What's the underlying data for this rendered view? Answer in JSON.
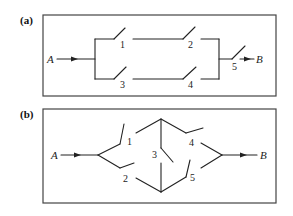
{
  "panels": [
    {
      "id": "a",
      "label": "(a)",
      "input": "A",
      "output": "B",
      "switches": [
        {
          "label": "1"
        },
        {
          "label": "2"
        },
        {
          "label": "3"
        },
        {
          "label": "4"
        },
        {
          "label": "5"
        }
      ],
      "description": "Switches 1-2 in series parallel with switches 3-4 in series, followed by switch 5 in series"
    },
    {
      "id": "b",
      "label": "(b)",
      "input": "A",
      "output": "B",
      "switches": [
        {
          "label": "1"
        },
        {
          "label": "2"
        },
        {
          "label": "3"
        },
        {
          "label": "4"
        },
        {
          "label": "5"
        }
      ],
      "description": "Bridge network: switches 1 and 2 from A, switch 3 bridging, switches 4 and 5 to B"
    }
  ],
  "colors": {
    "line": "#222222",
    "border": "#444444",
    "background": "#ffffff"
  }
}
